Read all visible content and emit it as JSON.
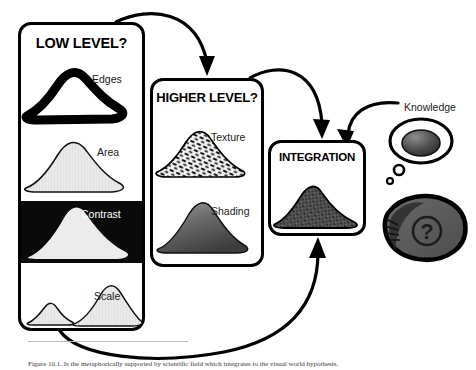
{
  "diagram": {
    "panels": [
      {
        "id": "low",
        "title": "LOW LEVEL?",
        "items": [
          {
            "label": "Edges",
            "icon": "mound-outline-thick-icon"
          },
          {
            "label": "Area",
            "icon": "mound-light-gray-icon"
          },
          {
            "label": "Contrast",
            "icon": "mound-on-black-icon"
          },
          {
            "label": "Scale",
            "icon": "two-mounds-icon"
          }
        ]
      },
      {
        "id": "high",
        "title": "HIGHER LEVEL?",
        "items": [
          {
            "label": "Texture",
            "icon": "mound-textured-icon"
          },
          {
            "label": "Shading",
            "icon": "mound-shaded-icon"
          }
        ]
      },
      {
        "id": "integration",
        "title": "INTEGRATION",
        "items": [
          {
            "label": "",
            "icon": "mound-dark-grainy-icon"
          }
        ]
      }
    ],
    "thought": {
      "label": "Knowledge",
      "bubble_icon": "thought-bubble-icon",
      "contents_icon": "mound-dark-dome-icon",
      "observer_icon": "eye-shell-question-icon",
      "question_mark": "?"
    },
    "arrows": [
      {
        "name": "low-to-higher",
        "from": "low",
        "to": "high"
      },
      {
        "name": "higher-to-integration",
        "from": "high",
        "to": "integration"
      },
      {
        "name": "low-to-integration",
        "from": "low",
        "to": "integration"
      },
      {
        "name": "knowledge-to-integration",
        "from": "knowledge",
        "to": "integration"
      }
    ],
    "colors": {
      "stroke": "#000000",
      "panel_fill": "#ffffff",
      "mound_light": "#e8e8e8",
      "mound_mid": "#808080",
      "mound_dark": "#4a4a4a",
      "contrast_bg": "#0a0a0a",
      "label_text": "#1a1a1a",
      "label_text_on_black": "#ffffff"
    }
  },
  "caption": {
    "text": "Figure 10.1. Is the metaphorically supported by scientific field which integrates to the visual world hypothesis."
  }
}
